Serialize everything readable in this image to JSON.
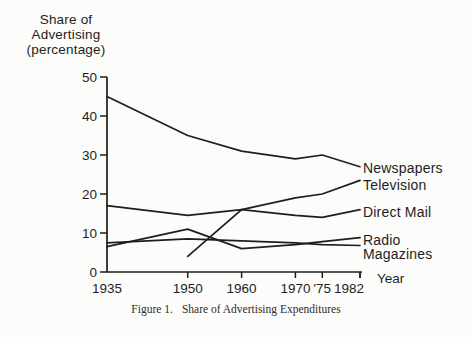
{
  "figure": {
    "y_axis_title_lines": [
      "Share of",
      "Advertising",
      "(percentage)"
    ],
    "caption_label": "Figure 1.",
    "caption_title": "Share of Advertising Expenditures"
  },
  "chart_data": {
    "type": "line",
    "title": "Share of Advertising Expenditures",
    "ylabel": "Share of Advertising (percentage)",
    "xlabel": "Year",
    "xlim": [
      1935,
      1982
    ],
    "ylim": [
      0,
      50
    ],
    "y_ticks": [
      0,
      10,
      20,
      30,
      40,
      50
    ],
    "x_ticks": [
      {
        "year": 1935,
        "label": "1935"
      },
      {
        "year": 1950,
        "label": "1950"
      },
      {
        "year": 1960,
        "label": "1960"
      },
      {
        "year": 1970,
        "label": "1970"
      },
      {
        "year": 1975,
        "label": "'75"
      },
      {
        "year": 1982,
        "label": "1982"
      }
    ],
    "grid": false,
    "line_color": "#1e1e1e",
    "legend_position": "right-of-line-ends",
    "series": [
      {
        "name": "Newspapers",
        "x": [
          1935,
          1950,
          1960,
          1970,
          1975,
          1982
        ],
        "values": [
          45,
          35,
          31,
          29,
          30,
          27
        ]
      },
      {
        "name": "Television",
        "x": [
          1950,
          1960,
          1970,
          1975,
          1982
        ],
        "values": [
          4,
          16,
          19,
          20,
          23.5
        ]
      },
      {
        "name": "Direct Mail",
        "x": [
          1935,
          1950,
          1960,
          1970,
          1975,
          1982
        ],
        "values": [
          17,
          14.5,
          16,
          14.5,
          14,
          16
        ]
      },
      {
        "name": "Radio",
        "x": [
          1935,
          1950,
          1960,
          1970,
          1975,
          1982
        ],
        "values": [
          6.5,
          11,
          6,
          7,
          7.8,
          8.8
        ]
      },
      {
        "name": "Magazines",
        "x": [
          1935,
          1950,
          1960,
          1970,
          1975,
          1982
        ],
        "values": [
          7.5,
          8.5,
          8,
          7.5,
          7,
          6.8
        ]
      }
    ]
  }
}
